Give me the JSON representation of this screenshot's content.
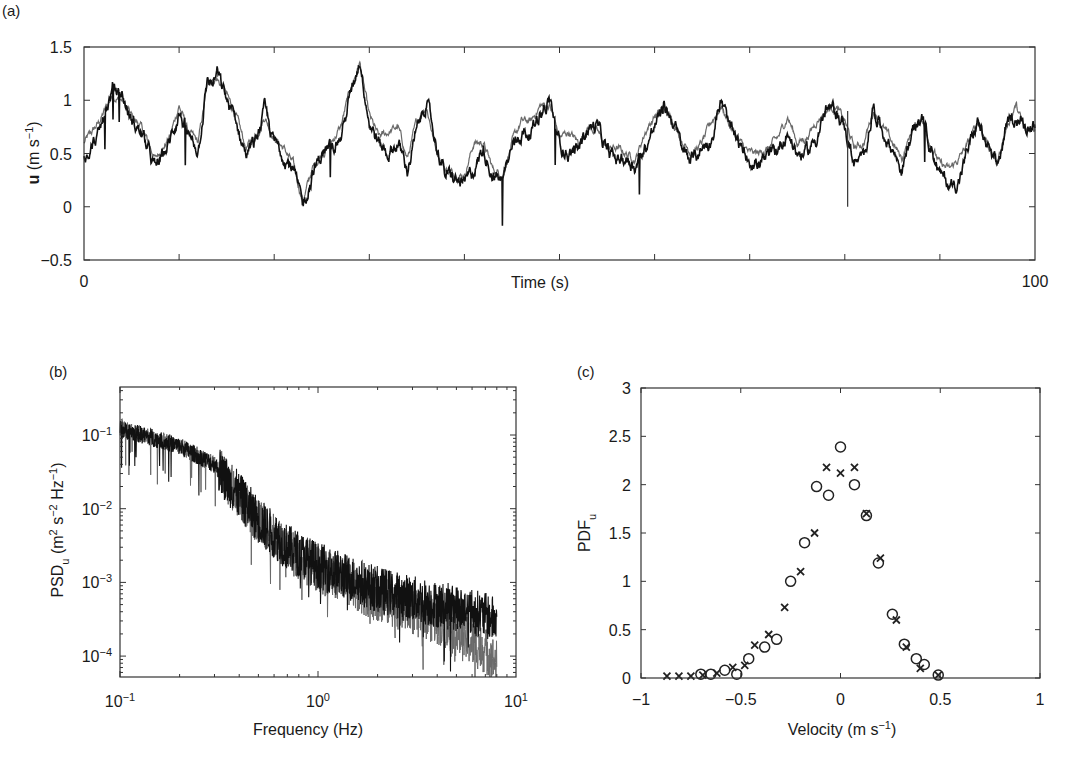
{
  "figure": {
    "panels": [
      {
        "id": "a",
        "label": "(a)"
      },
      {
        "id": "b",
        "label": "(b)"
      },
      {
        "id": "c",
        "label": "(c)"
      }
    ]
  },
  "colors": {
    "series_dark": "#111111",
    "series_gray": "#6a6a6a",
    "axes": "#333333",
    "background": "#ffffff"
  },
  "chart_data": [
    {
      "panel": "(a)",
      "type": "line",
      "title": "",
      "xlabel": "Time (s)",
      "ylabel": "u (m s⁻¹)",
      "xlim": [
        0,
        100
      ],
      "ylim": [
        -0.5,
        1.5
      ],
      "xticks": [
        0,
        10,
        20,
        30,
        40,
        50,
        60,
        70,
        80,
        90,
        100
      ],
      "xticklabels": [
        "0",
        "",
        "",
        "",
        "",
        "",
        "",
        "",
        "",
        "",
        "100"
      ],
      "yticks": [
        -0.5,
        0,
        0.5,
        1,
        1.5
      ],
      "yticklabels": [
        "−0.5",
        "0",
        "0.5",
        "1",
        "1.5"
      ],
      "grid": false,
      "series": [
        {
          "name": "measured (dark)",
          "color": "#111111",
          "x": [
            0,
            1.5,
            3,
            4,
            5,
            6,
            7.5,
            9,
            10,
            11,
            12,
            13,
            13.5,
            14,
            15,
            16,
            17,
            18,
            19,
            20,
            21,
            22,
            23,
            24,
            25,
            26,
            27,
            28,
            29,
            30,
            31,
            32,
            33,
            34,
            35,
            36,
            37,
            38,
            39,
            40,
            41,
            42,
            43,
            44,
            45,
            46,
            47,
            48,
            49,
            50,
            51,
            52,
            53,
            54,
            55,
            56,
            57,
            58,
            59,
            60,
            61,
            62,
            63,
            64,
            65,
            66,
            67,
            68,
            69,
            70,
            71,
            72,
            73,
            74,
            75,
            76,
            77,
            78,
            79,
            80,
            81,
            82,
            83,
            84,
            85,
            86,
            87,
            88,
            89,
            90,
            91,
            92,
            93,
            94,
            95,
            96,
            97,
            98,
            99,
            100
          ],
          "y": [
            0.5,
            0.65,
            1.1,
            1.05,
            0.8,
            0.7,
            0.35,
            0.6,
            0.9,
            0.65,
            0.55,
            1.2,
            1.15,
            1.25,
            1.0,
            0.8,
            0.5,
            0.6,
            0.9,
            0.6,
            0.5,
            0.35,
            0.0,
            0.3,
            0.5,
            0.55,
            0.65,
            1.05,
            1.4,
            0.8,
            0.6,
            0.5,
            0.6,
            0.35,
            0.7,
            1.0,
            0.6,
            0.3,
            0.25,
            0.2,
            0.35,
            0.55,
            0.3,
            0.25,
            0.55,
            0.7,
            0.7,
            0.9,
            1.0,
            0.6,
            0.5,
            0.55,
            0.75,
            0.75,
            0.5,
            0.45,
            0.45,
            0.4,
            0.55,
            0.75,
            0.95,
            0.8,
            0.5,
            0.45,
            0.55,
            0.65,
            1.0,
            0.7,
            0.55,
            0.45,
            0.4,
            0.45,
            0.55,
            0.7,
            0.5,
            0.5,
            0.65,
            0.9,
            0.9,
            0.75,
            0.4,
            0.45,
            0.95,
            0.7,
            0.55,
            0.35,
            0.65,
            0.85,
            0.6,
            0.3,
            0.2,
            0.25,
            0.55,
            0.8,
            0.55,
            0.35,
            0.75,
            0.85,
            0.75,
            0.8
          ]
        },
        {
          "name": "modelled (gray)",
          "color": "#6a6a6a",
          "x": [
            0,
            1.5,
            3,
            4,
            5,
            6,
            7.5,
            9,
            10,
            11,
            12,
            13,
            13.5,
            14,
            15,
            16,
            17,
            18,
            19,
            20,
            21,
            22,
            23,
            24,
            25,
            26,
            27,
            28,
            29,
            30,
            31,
            32,
            33,
            34,
            35,
            36,
            37,
            38,
            39,
            40,
            41,
            42,
            43,
            44,
            45,
            46,
            47,
            48,
            49,
            50,
            51,
            52,
            53,
            54,
            55,
            56,
            57,
            58,
            59,
            60,
            61,
            62,
            63,
            64,
            65,
            66,
            67,
            68,
            69,
            70,
            71,
            72,
            73,
            74,
            75,
            76,
            77,
            78,
            79,
            80,
            81,
            82,
            83,
            84,
            85,
            86,
            87,
            88,
            89,
            90,
            91,
            92,
            93,
            94,
            95,
            96,
            97,
            98,
            99,
            100
          ],
          "y": [
            0.6,
            0.78,
            1.05,
            1.0,
            0.85,
            0.75,
            0.45,
            0.65,
            0.95,
            0.7,
            0.6,
            1.15,
            1.2,
            1.2,
            1.05,
            0.85,
            0.55,
            0.65,
            0.85,
            0.65,
            0.55,
            0.4,
            0.05,
            0.35,
            0.5,
            0.6,
            0.75,
            1.1,
            1.35,
            0.85,
            0.65,
            0.7,
            0.75,
            0.45,
            0.8,
            0.95,
            0.55,
            0.35,
            0.3,
            0.3,
            0.6,
            0.6,
            0.35,
            0.3,
            0.6,
            0.8,
            0.8,
            0.95,
            0.95,
            0.65,
            0.7,
            0.6,
            0.75,
            0.7,
            0.55,
            0.55,
            0.5,
            0.45,
            0.7,
            0.85,
            0.9,
            0.8,
            0.6,
            0.5,
            0.6,
            0.8,
            0.95,
            0.75,
            0.6,
            0.5,
            0.5,
            0.55,
            0.65,
            0.85,
            0.6,
            0.65,
            0.8,
            0.9,
            0.95,
            0.8,
            0.55,
            0.6,
            0.9,
            0.75,
            0.6,
            0.45,
            0.7,
            0.85,
            0.6,
            0.4,
            0.35,
            0.45,
            0.6,
            0.8,
            0.6,
            0.4,
            0.75,
            0.95,
            0.7,
            0.75
          ]
        }
      ]
    },
    {
      "panel": "(b)",
      "type": "line",
      "title": "",
      "xlabel": "Frequency (Hz)",
      "ylabel": "PSD_u (m² s⁻² Hz⁻¹)",
      "xscale": "log",
      "yscale": "log",
      "xlim": [
        0.1,
        10
      ],
      "ylim": [
        5e-05,
        0.4
      ],
      "xticks": [
        0.1,
        1,
        10
      ],
      "xticklabels": [
        "10⁻¹",
        "10⁰",
        "10¹"
      ],
      "yticks": [
        0.0001,
        0.001,
        0.01,
        0.1
      ],
      "yticklabels": [
        "10⁻⁴",
        "10⁻³",
        "10⁻²",
        "10⁻¹"
      ],
      "grid": false,
      "series": [
        {
          "name": "measured (dark)",
          "color": "#111111",
          "x": [
            0.1,
            0.15,
            0.2,
            0.3,
            0.4,
            0.5,
            0.7,
            1.0,
            1.5,
            2.0,
            3.0,
            4.0,
            5.0,
            6.0,
            7.0,
            8.0
          ],
          "y": [
            0.12,
            0.09,
            0.07,
            0.04,
            0.015,
            0.007,
            0.003,
            0.0017,
            0.0011,
            0.0008,
            0.0006,
            0.0005,
            0.00045,
            0.0004,
            0.00035,
            0.0003
          ]
        },
        {
          "name": "modelled (gray)",
          "color": "#6a6a6a",
          "x": [
            0.1,
            0.15,
            0.2,
            0.3,
            0.4,
            0.5,
            0.7,
            1.0,
            1.5,
            2.0,
            3.0,
            4.0,
            5.0,
            6.0,
            7.0,
            8.0
          ],
          "y": [
            0.13,
            0.09,
            0.07,
            0.04,
            0.015,
            0.0065,
            0.0028,
            0.0015,
            0.0009,
            0.0006,
            0.0004,
            0.0003,
            0.0002,
            0.00015,
            0.00012,
            8e-05
          ]
        }
      ]
    },
    {
      "panel": "(c)",
      "type": "scatter",
      "title": "",
      "xlabel": "Velocity (m s⁻¹)",
      "ylabel": "PDF_u",
      "xlim": [
        -1,
        1
      ],
      "ylim": [
        0,
        3
      ],
      "xticks": [
        -1,
        -0.5,
        0,
        0.5,
        1
      ],
      "xticklabels": [
        "−1",
        "−0.5",
        "0",
        "0.5",
        "1"
      ],
      "yticks": [
        0,
        0.5,
        1,
        1.5,
        2,
        2.5,
        3
      ],
      "yticklabels": [
        "0",
        "0.5",
        "1",
        "1.5",
        "2",
        "2.5",
        "3"
      ],
      "grid": false,
      "series": [
        {
          "name": "circles",
          "marker": "o",
          "x": [
            -0.7,
            -0.65,
            -0.58,
            -0.52,
            -0.46,
            -0.38,
            -0.32,
            -0.25,
            -0.18,
            -0.12,
            -0.06,
            0.0,
            0.07,
            0.13,
            0.19,
            0.26,
            0.32,
            0.38,
            0.42,
            0.49
          ],
          "y": [
            0.04,
            0.04,
            0.08,
            0.04,
            0.2,
            0.32,
            0.4,
            1.0,
            1.4,
            1.98,
            1.89,
            2.39,
            2.0,
            1.68,
            1.19,
            0.66,
            0.35,
            0.2,
            0.14,
            0.03
          ]
        },
        {
          "name": "crosses",
          "marker": "x",
          "x": [
            -0.87,
            -0.81,
            -0.75,
            -0.69,
            -0.62,
            -0.54,
            -0.48,
            -0.43,
            -0.36,
            -0.28,
            -0.2,
            -0.13,
            -0.07,
            0.0,
            0.07,
            0.13,
            0.2,
            0.28,
            0.33,
            0.4,
            0.49
          ],
          "y": [
            0.02,
            0.02,
            0.02,
            0.03,
            0.05,
            0.11,
            0.13,
            0.34,
            0.45,
            0.73,
            1.1,
            1.5,
            2.18,
            2.12,
            2.18,
            1.7,
            1.24,
            0.6,
            0.32,
            0.1,
            0.03
          ]
        }
      ]
    }
  ]
}
